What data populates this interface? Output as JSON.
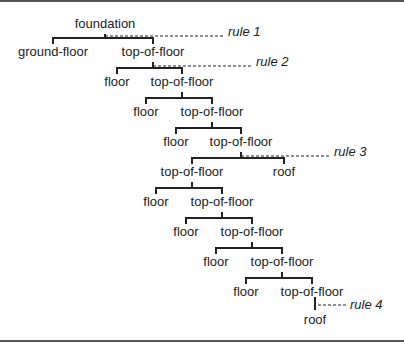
{
  "diagram": {
    "type": "parse-tree",
    "nodes": [
      {
        "id": "n0",
        "label": "foundation",
        "x": 105,
        "y": 28
      },
      {
        "id": "n1",
        "label": "ground-floor",
        "x": 53,
        "y": 50
      },
      {
        "id": "n2",
        "label": "top-of-floor",
        "x": 153,
        "y": 50
      },
      {
        "id": "n3",
        "label": "floor",
        "x": 117,
        "y": 80
      },
      {
        "id": "n4",
        "label": "top-of-floor",
        "x": 182,
        "y": 80
      },
      {
        "id": "n5",
        "label": "floor",
        "x": 146,
        "y": 110
      },
      {
        "id": "n6",
        "label": "top-of-floor",
        "x": 212,
        "y": 110
      },
      {
        "id": "n7",
        "label": "floor",
        "x": 176,
        "y": 140
      },
      {
        "id": "n8",
        "label": "top-of-floor",
        "x": 241,
        "y": 140
      },
      {
        "id": "n9",
        "label": "top-of-floor",
        "x": 192,
        "y": 170
      },
      {
        "id": "n10",
        "label": "roof",
        "x": 284,
        "y": 170
      },
      {
        "id": "n11",
        "label": "floor",
        "x": 156,
        "y": 200
      },
      {
        "id": "n12",
        "label": "top-of-floor",
        "x": 222,
        "y": 200
      },
      {
        "id": "n13",
        "label": "floor",
        "x": 186,
        "y": 230
      },
      {
        "id": "n14",
        "label": "top-of-floor",
        "x": 252,
        "y": 230
      },
      {
        "id": "n15",
        "label": "floor",
        "x": 216,
        "y": 260
      },
      {
        "id": "n16",
        "label": "top-of-floor",
        "x": 282,
        "y": 260
      },
      {
        "id": "n17",
        "label": "floor",
        "x": 246,
        "y": 290
      },
      {
        "id": "n18",
        "label": "top-of-floor",
        "x": 312,
        "y": 290
      },
      {
        "id": "n19",
        "label": "roof",
        "x": 315,
        "y": 322
      }
    ],
    "rules": [
      {
        "label": "rule 1",
        "x": 228,
        "y": 32
      },
      {
        "label": "rule 2",
        "x": 256,
        "y": 62
      },
      {
        "label": "rule 3",
        "x": 334,
        "y": 152
      },
      {
        "label": "rule 4",
        "x": 350,
        "y": 304
      }
    ]
  }
}
